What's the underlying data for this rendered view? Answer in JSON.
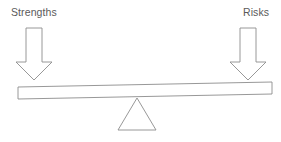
{
  "diagram": {
    "type": "balance-scale",
    "background_color": "#ffffff",
    "stroke_color": "#8c8c8c",
    "text_color": "#5a5a5a",
    "stroke_width": 0.9,
    "canvas": {
      "width": 281,
      "height": 142
    }
  },
  "labels": {
    "left": "Strengths",
    "right": "Risks"
  },
  "arrows": {
    "left": {
      "name": "strengths-arrow",
      "direction": "down",
      "shaft_x": 26,
      "shaft_width": 16,
      "top_y": 28,
      "tip_y": 80,
      "head_width": 36,
      "head_top_y": 62
    },
    "right": {
      "name": "risks-arrow",
      "direction": "down",
      "shaft_x": 240,
      "shaft_width": 16,
      "top_y": 28,
      "tip_y": 80,
      "head_width": 36,
      "head_top_y": 62
    }
  },
  "beam": {
    "name": "balance-beam",
    "tilt": "left-side-down",
    "left_top_y": 87,
    "left_bottom_y": 99,
    "right_top_y": 82,
    "right_bottom_y": 94,
    "left_x": 18,
    "right_x": 272
  },
  "fulcrum": {
    "name": "fulcrum-triangle",
    "apex_x": 137,
    "apex_y": 98,
    "base_left_x": 118,
    "base_right_x": 156,
    "base_y": 130
  }
}
